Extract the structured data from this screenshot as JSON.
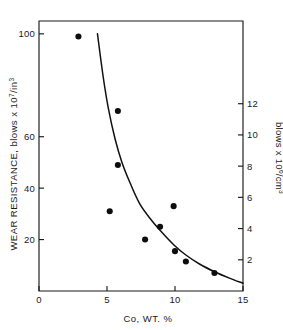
{
  "chart_data": {
    "type": "scatter",
    "title": "",
    "subtitle": "",
    "xlabel": "Co, WT. %",
    "ylabel": "WEAR RESISTANCE, blows x 10⁷/in³",
    "ylabel_right": "blows x 10⁶/cm³",
    "xlim": [
      0,
      15
    ],
    "ylim": [
      0,
      105
    ],
    "ylim_right": [
      0,
      17.3
    ],
    "grid": false,
    "legend": null,
    "xticks": [
      0,
      5,
      10,
      15
    ],
    "xtick_labels": [
      "0",
      "5",
      "10",
      "15"
    ],
    "yticks": [
      20,
      40,
      60,
      100
    ],
    "ytick_labels": [
      "20",
      "40",
      "60",
      "100"
    ],
    "yticks_right": [
      2,
      4,
      6,
      8,
      10,
      12
    ],
    "ytick_labels_right": [
      "2",
      "4",
      "6",
      "8",
      "10",
      "12"
    ],
    "series": [
      {
        "name": "measured points",
        "marker": "filled-circle",
        "color": "#0d0d0d",
        "points": [
          {
            "x": 2.9,
            "y": 99
          },
          {
            "x": 5.8,
            "y": 70
          },
          {
            "x": 5.8,
            "y": 49
          },
          {
            "x": 5.2,
            "y": 31
          },
          {
            "x": 9.9,
            "y": 33
          },
          {
            "x": 8.9,
            "y": 25
          },
          {
            "x": 7.8,
            "y": 20
          },
          {
            "x": 10.0,
            "y": 15.5
          },
          {
            "x": 10.8,
            "y": 11.5
          },
          {
            "x": 12.9,
            "y": 7
          }
        ]
      },
      {
        "name": "fitted curve",
        "marker": "none",
        "color": "#111111",
        "points": [
          {
            "x": 4.3,
            "y": 100
          },
          {
            "x": 4.7,
            "y": 84
          },
          {
            "x": 5.1,
            "y": 71
          },
          {
            "x": 5.6,
            "y": 59
          },
          {
            "x": 6.1,
            "y": 50
          },
          {
            "x": 6.7,
            "y": 42
          },
          {
            "x": 7.4,
            "y": 34
          },
          {
            "x": 8.2,
            "y": 28
          },
          {
            "x": 9.0,
            "y": 23
          },
          {
            "x": 9.9,
            "y": 18
          },
          {
            "x": 10.8,
            "y": 14
          },
          {
            "x": 11.8,
            "y": 10.5
          },
          {
            "x": 12.9,
            "y": 7.5
          },
          {
            "x": 14.0,
            "y": 5
          },
          {
            "x": 15.0,
            "y": 3
          }
        ]
      }
    ]
  },
  "labels": {
    "x_axis_title": "Co, WT. %",
    "y_axis_left_main": "WEAR RESISTANCE, blows x 10",
    "y_axis_left_sup1": "7",
    "y_axis_left_mid": "/in",
    "y_axis_left_sup2": "3",
    "y_axis_right_main": "blows x 10",
    "y_axis_right_sup1": "6",
    "y_axis_right_mid": "/cm",
    "y_axis_right_sup2": "3"
  }
}
